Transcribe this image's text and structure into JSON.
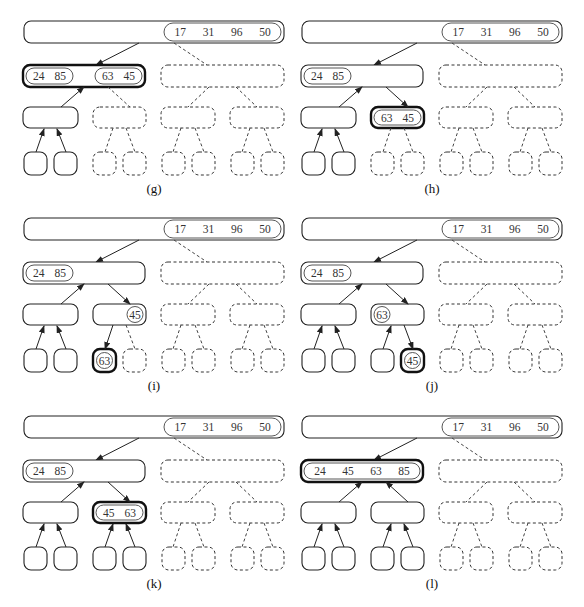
{
  "figure": {
    "colors": {
      "stroke": "#222222",
      "text": "#333333",
      "background": "#ffffff"
    }
  },
  "panels": [
    {
      "label": "(g)",
      "root": {
        "values": [
          "17",
          "31",
          "96",
          "50"
        ]
      },
      "l1_left": {
        "style": "bold",
        "groups": [
          {
            "values": [
              "24",
              "85"
            ],
            "pos": "left"
          },
          {
            "values": [
              "63",
              "45"
            ],
            "pos": "right"
          }
        ]
      },
      "l1_right": {
        "style": "dashed"
      },
      "l2": [
        {
          "style": "solid"
        },
        {
          "style": "dashed"
        },
        {
          "style": "dashed"
        },
        {
          "style": "dashed"
        }
      ],
      "leaves": [
        "solid",
        "solid",
        "dashed",
        "dashed",
        "dashed",
        "dashed",
        "dashed",
        "dashed"
      ],
      "leaf_values": {},
      "arrows": {
        "root_to_l1left": "down",
        "l1left_from_l2a": "up",
        "l1left_to_l2b": "dashed",
        "l2a_from_leaves": "up",
        "l2b_to_leaves": "dashed"
      }
    },
    {
      "label": "(h)",
      "root": {
        "values": [
          "17",
          "31",
          "96",
          "50"
        ]
      },
      "l1_left": {
        "style": "solid",
        "groups": [
          {
            "values": [
              "24",
              "85"
            ],
            "pos": "left"
          }
        ]
      },
      "l1_right": {
        "style": "dashed"
      },
      "l2": [
        {
          "style": "solid"
        },
        {
          "style": "bold",
          "groups": [
            {
              "values": [
                "63",
                "45"
              ],
              "pos": "full"
            }
          ]
        },
        {
          "style": "dashed"
        },
        {
          "style": "dashed"
        }
      ],
      "leaves": [
        "solid",
        "solid",
        "dashed",
        "dashed",
        "dashed",
        "dashed",
        "dashed",
        "dashed"
      ],
      "leaf_values": {},
      "arrows": {
        "root_to_l1left": "down",
        "l1left_from_l2a": "up",
        "l1left_to_l2b": "down",
        "l2a_from_leaves": "up",
        "l2b_to_leaves": "dashed"
      }
    },
    {
      "label": "(i)",
      "root": {
        "values": [
          "17",
          "31",
          "96",
          "50"
        ]
      },
      "l1_left": {
        "style": "solid",
        "groups": [
          {
            "values": [
              "24",
              "85"
            ],
            "pos": "left"
          }
        ]
      },
      "l1_right": {
        "style": "dashed"
      },
      "l2": [
        {
          "style": "solid"
        },
        {
          "style": "solid",
          "circle": {
            "value": "45",
            "pos": "right"
          }
        },
        {
          "style": "dashed"
        },
        {
          "style": "dashed"
        }
      ],
      "leaves": [
        "solid",
        "solid",
        "bold",
        "dashed",
        "dashed",
        "dashed",
        "dashed",
        "dashed"
      ],
      "leaf_values": {
        "2": "63"
      },
      "arrows": {
        "root_to_l1left": "down",
        "l1left_from_l2a": "up",
        "l1left_to_l2b": "down",
        "l2a_from_leaves": "up",
        "l2b_to_leaves": "left-down"
      }
    },
    {
      "label": "(j)",
      "root": {
        "values": [
          "17",
          "31",
          "96",
          "50"
        ]
      },
      "l1_left": {
        "style": "solid",
        "groups": [
          {
            "values": [
              "24",
              "85"
            ],
            "pos": "left"
          }
        ]
      },
      "l1_right": {
        "style": "dashed"
      },
      "l2": [
        {
          "style": "solid"
        },
        {
          "style": "solid",
          "circle": {
            "value": "63",
            "pos": "left"
          }
        },
        {
          "style": "dashed"
        },
        {
          "style": "dashed"
        }
      ],
      "leaves": [
        "solid",
        "solid",
        "solid",
        "bold",
        "dashed",
        "dashed",
        "dashed",
        "dashed"
      ],
      "leaf_values": {
        "3": "45"
      },
      "arrows": {
        "root_to_l1left": "down",
        "l1left_from_l2a": "up",
        "l1left_to_l2b": "down",
        "l2a_from_leaves": "up",
        "l2b_to_leaves": "left-up-right-down"
      }
    },
    {
      "label": "(k)",
      "root": {
        "values": [
          "17",
          "31",
          "96",
          "50"
        ]
      },
      "l1_left": {
        "style": "solid",
        "groups": [
          {
            "values": [
              "24",
              "85"
            ],
            "pos": "left"
          }
        ]
      },
      "l1_right": {
        "style": "dashed"
      },
      "l2": [
        {
          "style": "solid"
        },
        {
          "style": "bold",
          "groups": [
            {
              "values": [
                "45",
                "63"
              ],
              "pos": "full"
            }
          ]
        },
        {
          "style": "dashed"
        },
        {
          "style": "dashed"
        }
      ],
      "leaves": [
        "solid",
        "solid",
        "solid",
        "solid",
        "dashed",
        "dashed",
        "dashed",
        "dashed"
      ],
      "leaf_values": {},
      "arrows": {
        "root_to_l1left": "down",
        "l1left_from_l2a": "up",
        "l1left_to_l2b": "down",
        "l2a_from_leaves": "up",
        "l2b_to_leaves": "up"
      }
    },
    {
      "label": "(l)",
      "root": {
        "values": [
          "17",
          "31",
          "96",
          "50"
        ]
      },
      "l1_left": {
        "style": "bold",
        "groups": [
          {
            "values": [
              "24",
              "45",
              "63",
              "85"
            ],
            "pos": "full"
          }
        ]
      },
      "l1_right": {
        "style": "dashed"
      },
      "l2": [
        {
          "style": "solid"
        },
        {
          "style": "solid"
        },
        {
          "style": "dashed"
        },
        {
          "style": "dashed"
        }
      ],
      "leaves": [
        "solid",
        "solid",
        "solid",
        "solid",
        "dashed",
        "dashed",
        "dashed",
        "dashed"
      ],
      "leaf_values": {},
      "arrows": {
        "root_to_l1left": "down",
        "l1left_from_l2a": "up",
        "l1left_to_l2b": "up",
        "l2a_from_leaves": "up",
        "l2b_to_leaves": "up"
      }
    }
  ],
  "panel_origins": [
    [
      24,
      21
    ],
    [
      302,
      21
    ],
    [
      24,
      218
    ],
    [
      302,
      218
    ],
    [
      24,
      416
    ],
    [
      302,
      416
    ]
  ]
}
